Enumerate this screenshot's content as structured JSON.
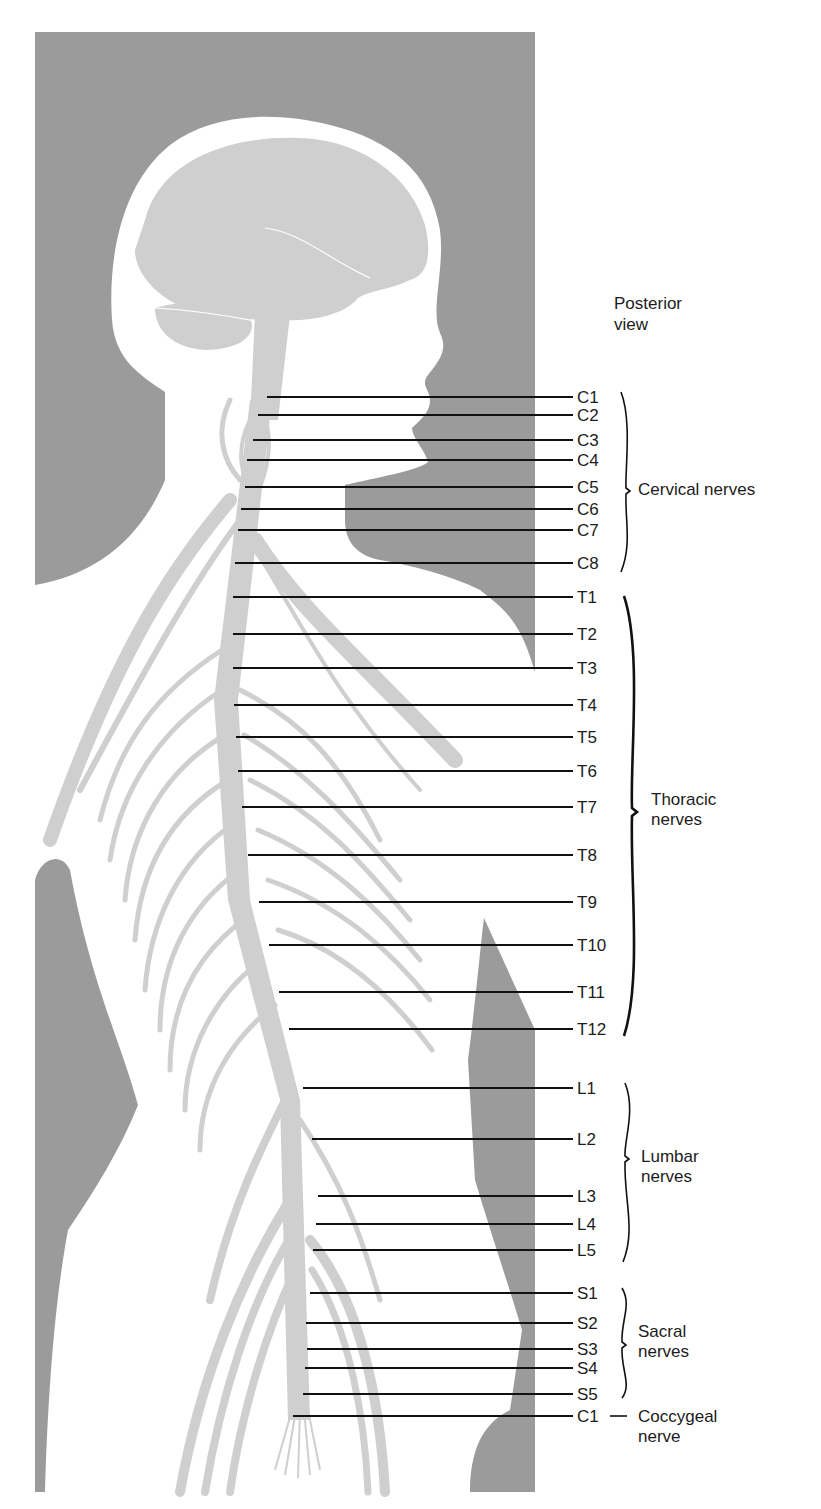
{
  "figure": {
    "view_label_line1": "Posterior",
    "view_label_line2": "view",
    "colors": {
      "background_panel": "#9b9b9b",
      "body": "#ffffff",
      "nervous_tissue": "#cfcfcf",
      "leader_lines": "#111111",
      "text": "#1c1c1c"
    }
  },
  "groups": [
    {
      "id": "cervical",
      "line1": "Cervical nerves",
      "line2": ""
    },
    {
      "id": "thoracic",
      "line1": "Thoracic",
      "line2": "nerves"
    },
    {
      "id": "lumbar",
      "line1": "Lumbar",
      "line2": "nerves"
    },
    {
      "id": "sacral",
      "line1": "Sacral",
      "line2": "nerves"
    },
    {
      "id": "coccygeal",
      "line1": "Coccygeal",
      "line2": "nerve"
    }
  ],
  "nerves": [
    {
      "label": "C1",
      "group": "cervical",
      "y": 397,
      "x_start": 267
    },
    {
      "label": "C2",
      "group": "cervical",
      "y": 415,
      "x_start": 258
    },
    {
      "label": "C3",
      "group": "cervical",
      "y": 440,
      "x_start": 253
    },
    {
      "label": "C4",
      "group": "cervical",
      "y": 460,
      "x_start": 247
    },
    {
      "label": "C5",
      "group": "cervical",
      "y": 487,
      "x_start": 245
    },
    {
      "label": "C6",
      "group": "cervical",
      "y": 509,
      "x_start": 241
    },
    {
      "label": "C7",
      "group": "cervical",
      "y": 530,
      "x_start": 238
    },
    {
      "label": "C8",
      "group": "cervical",
      "y": 563,
      "x_start": 235
    },
    {
      "label": "T1",
      "group": "thoracic",
      "y": 597,
      "x_start": 233
    },
    {
      "label": "T2",
      "group": "thoracic",
      "y": 634,
      "x_start": 233
    },
    {
      "label": "T3",
      "group": "thoracic",
      "y": 668,
      "x_start": 233
    },
    {
      "label": "T4",
      "group": "thoracic",
      "y": 705,
      "x_start": 234
    },
    {
      "label": "T5",
      "group": "thoracic",
      "y": 737,
      "x_start": 236
    },
    {
      "label": "T6",
      "group": "thoracic",
      "y": 771,
      "x_start": 238
    },
    {
      "label": "T7",
      "group": "thoracic",
      "y": 807,
      "x_start": 242
    },
    {
      "label": "T8",
      "group": "thoracic",
      "y": 855,
      "x_start": 248
    },
    {
      "label": "T9",
      "group": "thoracic",
      "y": 902,
      "x_start": 259
    },
    {
      "label": "T10",
      "group": "thoracic",
      "y": 945,
      "x_start": 269
    },
    {
      "label": "T11",
      "group": "thoracic",
      "y": 992,
      "x_start": 279
    },
    {
      "label": "T12",
      "group": "thoracic",
      "y": 1029,
      "x_start": 289
    },
    {
      "label": "L1",
      "group": "lumbar",
      "y": 1088,
      "x_start": 303
    },
    {
      "label": "L2",
      "group": "lumbar",
      "y": 1139,
      "x_start": 312
    },
    {
      "label": "L3",
      "group": "lumbar",
      "y": 1196,
      "x_start": 318
    },
    {
      "label": "L4",
      "group": "lumbar",
      "y": 1224,
      "x_start": 316
    },
    {
      "label": "L5",
      "group": "lumbar",
      "y": 1250,
      "x_start": 313
    },
    {
      "label": "S1",
      "group": "sacral",
      "y": 1293,
      "x_start": 310
    },
    {
      "label": "S2",
      "group": "sacral",
      "y": 1323,
      "x_start": 306
    },
    {
      "label": "S3",
      "group": "sacral",
      "y": 1349,
      "x_start": 307
    },
    {
      "label": "S4",
      "group": "sacral",
      "y": 1368,
      "x_start": 305
    },
    {
      "label": "S5",
      "group": "sacral",
      "y": 1394,
      "x_start": 303
    },
    {
      "label": "C1",
      "group": "coccygeal",
      "y": 1416,
      "x_start": 293
    }
  ]
}
